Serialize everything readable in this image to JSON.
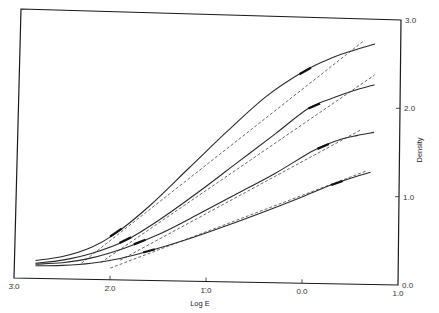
{
  "chart_data": {
    "type": "line",
    "title": "",
    "xlabel": "Log E",
    "ylabel": "Density",
    "xlim": [
      -3.0,
      1.0
    ],
    "ylim": [
      0.0,
      3.0
    ],
    "x_ticks": [
      {
        "value": -3.0,
        "label": "3̄.0"
      },
      {
        "value": -2.0,
        "label": "2̄.0"
      },
      {
        "value": -1.0,
        "label": "1̄.0"
      },
      {
        "value": 0.0,
        "label": "0.0"
      },
      {
        "value": 1.0,
        "label": "1.0"
      }
    ],
    "y_ticks": [
      {
        "value": 0.0,
        "label": "0.0"
      },
      {
        "value": 1.0,
        "label": "1.0"
      },
      {
        "value": 2.0,
        "label": "2.0"
      },
      {
        "value": 3.0,
        "label": "3.0"
      }
    ],
    "y_axis_side": "right",
    "grid": false,
    "legend": "none",
    "series": [
      {
        "name": "curve-1",
        "x": [
          -2.78,
          -2.5,
          -2.2,
          -1.95,
          -1.6,
          -1.2,
          -0.8,
          -0.4,
          0.0,
          0.3,
          0.5,
          0.73
        ],
        "y": [
          0.2,
          0.25,
          0.36,
          0.52,
          0.84,
          1.27,
          1.7,
          2.1,
          2.4,
          2.56,
          2.64,
          2.72
        ],
        "tangent": {
          "x": [
            -2.3,
            0.62
          ],
          "y": [
            0.18,
            2.76
          ]
        },
        "markers_x": [
          -1.95,
          0.0
        ]
      },
      {
        "name": "curve-2",
        "x": [
          -2.78,
          -2.5,
          -2.2,
          -1.85,
          -1.5,
          -1.1,
          -0.7,
          -0.3,
          0.05,
          0.35,
          0.55,
          0.73
        ],
        "y": [
          0.17,
          0.21,
          0.29,
          0.44,
          0.68,
          1.0,
          1.34,
          1.68,
          1.98,
          2.12,
          2.2,
          2.26
        ],
        "tangent": {
          "x": [
            -2.1,
            0.73
          ],
          "y": [
            0.19,
            2.37
          ]
        },
        "markers_x": [
          -1.85,
          0.1
        ]
      },
      {
        "name": "curve-3",
        "x": [
          -2.78,
          -2.5,
          -2.2,
          -1.85,
          -1.5,
          -1.1,
          -0.7,
          -0.3,
          0.1,
          0.35,
          0.55,
          0.73
        ],
        "y": [
          0.16,
          0.18,
          0.24,
          0.36,
          0.52,
          0.75,
          0.99,
          1.23,
          1.5,
          1.62,
          1.68,
          1.72
        ],
        "tangent": {
          "x": [
            -1.9,
            0.6
          ],
          "y": [
            0.22,
            1.75
          ]
        },
        "markers_x": [
          -1.7,
          0.2
        ]
      },
      {
        "name": "curve-4",
        "x": [
          -2.78,
          -2.5,
          -2.2,
          -1.9,
          -1.6,
          -1.2,
          -0.8,
          -0.4,
          0.0,
          0.3,
          0.5,
          0.7
        ],
        "y": [
          0.14,
          0.15,
          0.18,
          0.24,
          0.33,
          0.47,
          0.63,
          0.8,
          0.98,
          1.12,
          1.2,
          1.27
        ],
        "tangent": {
          "x": [
            -2.0,
            0.65
          ],
          "y": [
            0.13,
            1.28
          ]
        },
        "markers_x": [
          -1.6,
          0.35
        ]
      }
    ]
  }
}
